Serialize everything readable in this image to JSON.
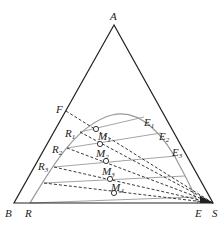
{
  "diagram": {
    "type": "ternary-phase-diagram",
    "vertices": {
      "A": {
        "label": "A",
        "x": 114,
        "y": 25
      },
      "B": {
        "label": "B",
        "x": 14,
        "y": 203
      },
      "S": {
        "label": "S",
        "x": 213,
        "y": 203
      }
    },
    "points": {
      "F": {
        "label": "F",
        "x": 66,
        "y": 111
      },
      "R": {
        "label": "R",
        "x": 30,
        "y": 203
      },
      "E": {
        "label": "E",
        "x": 198,
        "y": 203
      }
    },
    "raffinate_labels": [
      {
        "label": "R",
        "sub": "1",
        "x": 36,
        "y": 135
      },
      {
        "label": "R",
        "sub": "2",
        "x": 28,
        "y": 152
      },
      {
        "label": "R",
        "sub": "3",
        "x": 19,
        "y": 170
      }
    ],
    "extract_labels": [
      {
        "label": "E",
        "sub": "1",
        "x": 144,
        "y": 124
      },
      {
        "label": "E",
        "sub": "2",
        "x": 160,
        "y": 140
      },
      {
        "label": "E",
        "sub": "3",
        "x": 173,
        "y": 156
      }
    ],
    "mixture_labels": [
      {
        "label": "M",
        "sub": "1",
        "x": 98,
        "y": 140
      },
      {
        "label": "M",
        "sub": "2",
        "x": 96,
        "y": 157
      },
      {
        "label": "M",
        "sub": "3",
        "x": 102,
        "y": 175
      },
      {
        "label": "M",
        "sub": "4",
        "x": 111,
        "y": 191
      }
    ],
    "mixture_points": [
      {
        "x": 96,
        "y": 129
      },
      {
        "x": 100,
        "y": 144
      },
      {
        "x": 106,
        "y": 161
      },
      {
        "x": 110,
        "y": 179
      },
      {
        "x": 114,
        "y": 193
      }
    ],
    "colors": {
      "triangle": "#222222",
      "curve": "#999999",
      "tie_lines": "#9a9a9a",
      "dashed": "#222222"
    }
  }
}
